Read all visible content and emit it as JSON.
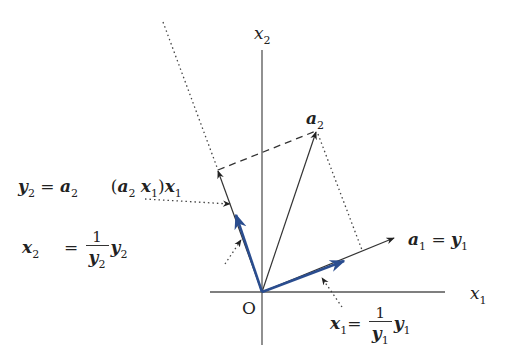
{
  "figure": {
    "colors": {
      "ink": "#333333",
      "blue": "#2a4d8f"
    },
    "axes": {
      "origin_label": "O",
      "x_axis_label": {
        "var": "x",
        "sub": "1"
      },
      "y_axis_label": {
        "var": "x",
        "sub": "2"
      }
    },
    "vectors": {
      "a1_eq_y1": {
        "lhs": "a",
        "lhs_sub": "1",
        "eq": "=",
        "rhs": "y",
        "rhs_sub": "1"
      },
      "a2": {
        "var": "a",
        "sub": "2"
      },
      "y2_def": {
        "lhs": "y",
        "lhs_sub": "2",
        "eq": "=",
        "t1": "a",
        "t1_sub": "2",
        "open": "(",
        "t2": "a",
        "t2_sub": "2",
        "t3": "x",
        "t3_sub": "1",
        "close": ")",
        "t4": "x",
        "t4_sub": "1"
      },
      "x2_def": {
        "lhs": "x",
        "lhs_sub": "2",
        "eq": "=",
        "num": "1",
        "den": "y",
        "den_sub": "2",
        "rhs": "y",
        "rhs_sub": "2"
      },
      "x1_def": {
        "lhs": "x",
        "lhs_sub": "1",
        "eq": "=",
        "num": "1",
        "den": "y",
        "den_sub": "1",
        "rhs": "y",
        "rhs_sub": "1"
      }
    }
  }
}
